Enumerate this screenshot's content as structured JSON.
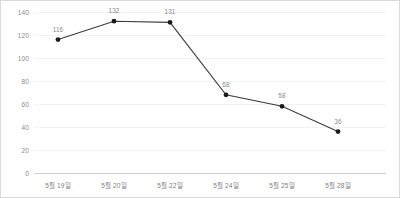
{
  "chart_data": {
    "type": "line",
    "title": "",
    "xlabel": "",
    "ylabel": "",
    "categories": [
      "5월 19일",
      "5월 20일",
      "5월 22일",
      "5월 24일",
      "5월 25일",
      "5월 28일"
    ],
    "values": [
      116,
      132,
      131,
      68,
      58,
      36
    ],
    "point_labels": [
      "116",
      "132",
      "131",
      "68",
      "58",
      "36"
    ],
    "ylim": [
      0,
      140
    ],
    "ytick_step": 20,
    "yticks": [
      0,
      20,
      40,
      60,
      80,
      100,
      120,
      140
    ],
    "ytick_labels": [
      "0",
      "20",
      "40",
      "60",
      "80",
      "100",
      "120",
      "140"
    ],
    "grid": true,
    "legend": false,
    "legend_position": "none",
    "series": [
      {
        "name": "",
        "values": [
          116,
          132,
          131,
          68,
          58,
          36
        ]
      }
    ],
    "colors": {
      "line": "#3c3c3c",
      "marker": "#1a1a1a",
      "gridline": "#f2f2f2",
      "axis": "#cfcfcf",
      "tick_label": "#8a8a8a",
      "point_label": "#8a8a8a",
      "background": "#ffffff",
      "border": "#d9d9d9"
    }
  }
}
